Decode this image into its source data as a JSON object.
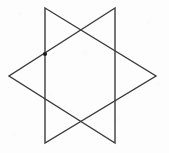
{
  "figure": {
    "name": "hexagram-star-of-david",
    "canvas": {
      "width": 169,
      "height": 153
    },
    "background_color": "#fdfdfd",
    "stroke_color": "#3c3c3c",
    "stroke_width": 1.4,
    "marker_color": "#1a1a1a",
    "vertices": {
      "top_left": {
        "x": 45,
        "y": 8
      },
      "top_right": {
        "x": 115,
        "y": 8
      },
      "bottom_left": {
        "x": 45,
        "y": 143
      },
      "bottom_right": {
        "x": 115,
        "y": 143
      },
      "left_point": {
        "x": 9,
        "y": 76
      },
      "right_point": {
        "x": 156,
        "y": 76
      }
    },
    "triangles": [
      {
        "name": "right-pointing-triangle",
        "points": "45,8 156,76 45,143"
      },
      {
        "name": "left-pointing-triangle",
        "points": "115,8 9,76 115,143"
      }
    ],
    "intersection_marker": {
      "name": "upper-left-node",
      "x": 45,
      "y": 54,
      "radius": 2.1
    }
  }
}
